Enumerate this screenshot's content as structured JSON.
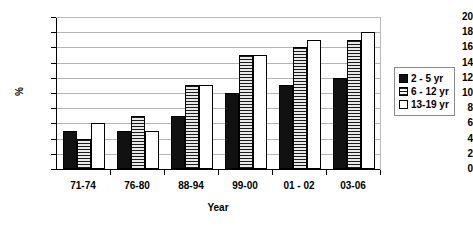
{
  "chart_data": {
    "type": "bar",
    "title": "",
    "xlabel": "Year",
    "ylabel": "%",
    "categories": [
      "71-74",
      "76-80",
      "88-94",
      "99-00",
      "01 - 02",
      "03-06"
    ],
    "series": [
      {
        "name": "2 - 5 yr",
        "values": [
          5,
          5,
          7,
          10,
          11,
          12
        ]
      },
      {
        "name": "6 - 12 yr",
        "values": [
          4,
          7,
          11,
          15,
          16,
          17
        ]
      },
      {
        "name": "13-19 yr",
        "values": [
          6,
          5,
          11,
          15,
          17,
          18
        ]
      }
    ],
    "ylim": [
      0,
      20
    ],
    "ytick_step": 2,
    "yticks": [
      0,
      2,
      4,
      6,
      8,
      10,
      12,
      14,
      16,
      18,
      20
    ],
    "grid": true,
    "legend_position": "right",
    "colors": {
      "series_0_fill": "#111111",
      "series_1_fill": "#1a1a1a",
      "series_2_fill": "#ffffff",
      "bar_outline": "#000000",
      "gridline": "#b3b3b3",
      "axis": "#000000",
      "background": "#ffffff",
      "legend_border": "#8a8a8a"
    }
  },
  "legend": {
    "items": [
      {
        "label": "2 - 5 yr"
      },
      {
        "label": "6 - 12 yr"
      },
      {
        "label": "13-19 yr"
      }
    ]
  }
}
